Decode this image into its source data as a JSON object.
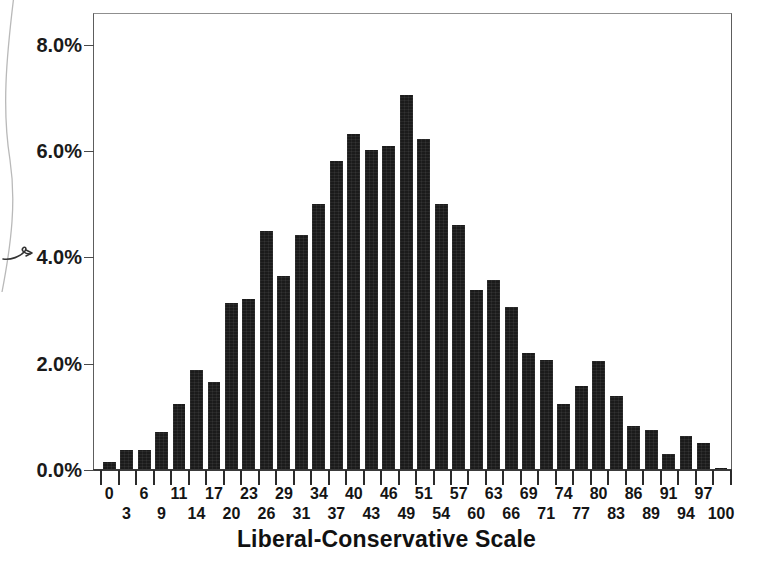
{
  "figure": {
    "background": "#ffffff",
    "bar_color": "#1b1b1b",
    "axis_color": "#3a3a3a",
    "frame_color": "#5d5d5d"
  },
  "artifacts": {
    "scan_curve_name": "scan-edge-curve",
    "scan_arrow_name": "handwritten-arrow-mark"
  },
  "chart_data": {
    "type": "bar",
    "title": "",
    "xlabel": "Liberal-Conservative Scale",
    "ylabel": "",
    "ylim": [
      0,
      8.6
    ],
    "xlim": [
      0,
      100
    ],
    "grid": false,
    "legend": "none",
    "y_tick_labels": [
      "0.0%",
      "2.0%",
      "4.0%",
      "6.0%",
      "8.0%"
    ],
    "y_tick_values": [
      0.0,
      2.0,
      4.0,
      6.0,
      8.0
    ],
    "categories": [
      "0",
      "3",
      "6",
      "9",
      "11",
      "14",
      "17",
      "20",
      "23",
      "26",
      "29",
      "31",
      "34",
      "37",
      "40",
      "43",
      "46",
      "49",
      "51",
      "54",
      "57",
      "60",
      "63",
      "66",
      "69",
      "71",
      "74",
      "77",
      "80",
      "83",
      "86",
      "89",
      "91",
      "94",
      "97",
      "100"
    ],
    "values": [
      0.15,
      0.38,
      0.38,
      0.72,
      1.25,
      1.88,
      1.65,
      3.15,
      3.22,
      4.5,
      3.65,
      4.42,
      5.0,
      5.82,
      6.33,
      6.02,
      6.1,
      7.05,
      6.22,
      5.0,
      4.62,
      3.38,
      3.58,
      3.07,
      2.2,
      2.07,
      1.25,
      1.58,
      2.05,
      1.4,
      0.82,
      0.76,
      0.3,
      0.64,
      0.5,
      0.04
    ],
    "units": "percent"
  }
}
